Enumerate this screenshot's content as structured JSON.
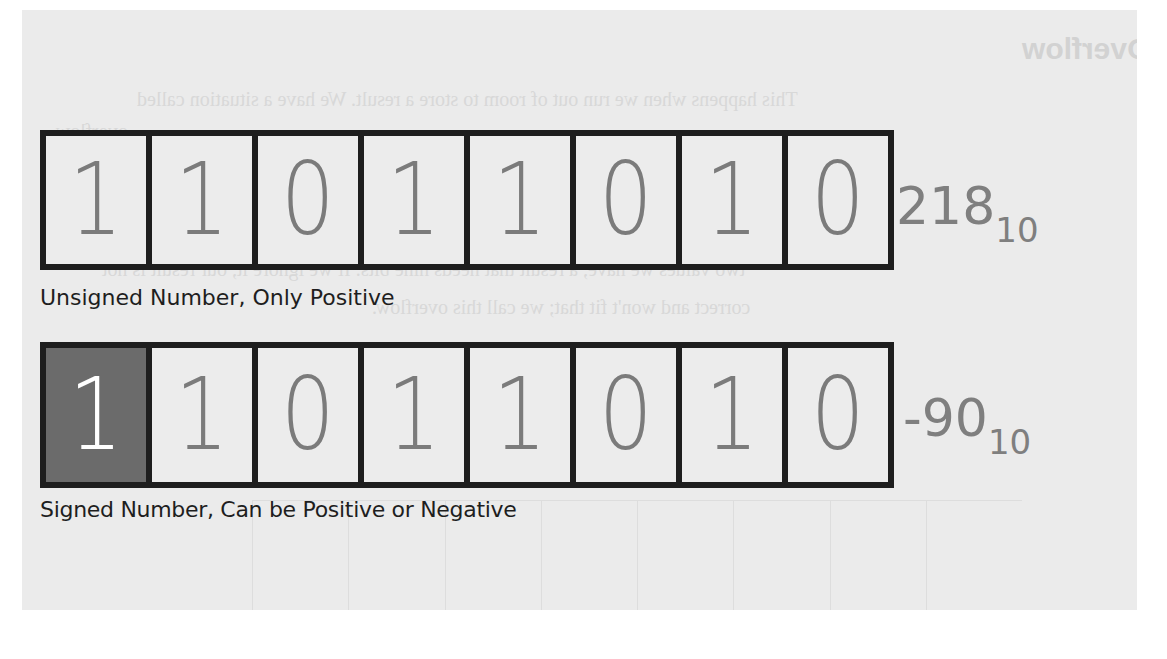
{
  "background": {
    "paper_color": "#ebebeb",
    "bleed_through": {
      "heading": "Overflow",
      "lines": [
        "This happens when we run out of room to store a result. We have a situation called",
        "overflow.",
        "Let's look at this with an example. We have eight bits to work with. We keep",
        "the number in the range of positive values that can be stored, but if we add the",
        "two values we have, a result that needs nine bits. If we ignore it, our result is not",
        "correct and won't fit that; we call this overflow."
      ]
    }
  },
  "colors": {
    "border": "#1e1e1e",
    "digit": "#7b7b7b",
    "sign_bit_fill": "#6b6b6b",
    "sign_bit_digit": "#ffffff",
    "value_text": "#7f7f7f",
    "caption_text": "#1e1e1e"
  },
  "registers": [
    {
      "id": "unsigned",
      "bits": [
        "1",
        "1",
        "0",
        "1",
        "1",
        "0",
        "1",
        "0"
      ],
      "sign_bit_highlighted": false,
      "caption": "Unsigned Number, Only Positive",
      "value": "218",
      "base": "10"
    },
    {
      "id": "signed",
      "bits": [
        "1",
        "1",
        "0",
        "1",
        "1",
        "0",
        "1",
        "0"
      ],
      "sign_bit_highlighted": true,
      "caption": "Signed Number, Can be Positive or Negative",
      "value": "-90",
      "base": "10"
    }
  ]
}
